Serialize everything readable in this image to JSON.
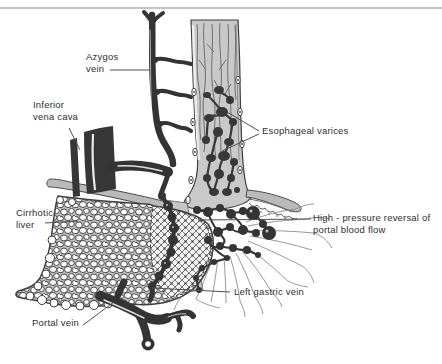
{
  "figure": {
    "labels": {
      "azygos_vein": {
        "line1": "Azygos",
        "line2": "vein"
      },
      "inferior_vena_cava": {
        "line1": "Inferior",
        "line2": "vena cava"
      },
      "esophageal_varices": {
        "text": "Esophageal varices"
      },
      "cirrhotic_liver": {
        "line1": "Cirrhotic",
        "line2": "liver"
      },
      "high_pressure_reversal": {
        "line1": "High - pressure reversal of",
        "line2": "portal blood flow"
      },
      "left_gastric_vein": {
        "text": "Left gastric vein"
      },
      "portal_vein": {
        "text": "Portal vein"
      }
    },
    "colors": {
      "background": "#ffffff",
      "top_rule": "#c4c4c4",
      "vessel_dark": "#363636",
      "esophagus_fill": "#c9c9c9",
      "diaphragm_fill": "#bababa",
      "outline": "#3f3f3f",
      "thin_vein_gray": "#8d8d8d",
      "label_text": "#2f2f2f"
    },
    "structures": [
      "azygos-vein",
      "inferior-vena-cava",
      "esophagus-with-varices",
      "diaphragm",
      "cirrhotic-liver",
      "left-gastric-vein",
      "stomach-veins",
      "portal-vein"
    ]
  }
}
